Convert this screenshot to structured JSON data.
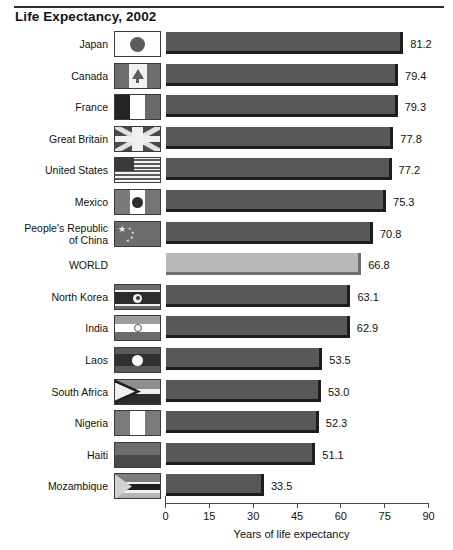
{
  "chart_data": {
    "type": "bar",
    "orientation": "horizontal",
    "title": "Life Expectancy, 2002",
    "xlabel": "Years of life expectancy",
    "ylabel": "",
    "xlim": [
      0,
      90
    ],
    "xticks": [
      0,
      15,
      30,
      45,
      60,
      75,
      90
    ],
    "grid": false,
    "legend": null,
    "categories": [
      "Japan",
      "Canada",
      "France",
      "Great Britain",
      "United States",
      "Mexico",
      "People's Republic\nof China",
      "WORLD",
      "North Korea",
      "India",
      "Laos",
      "South Africa",
      "Nigeria",
      "Haiti",
      "Mozambique"
    ],
    "values": [
      81.2,
      79.4,
      79.3,
      77.8,
      77.2,
      75.3,
      70.8,
      66.8,
      63.1,
      62.9,
      53.5,
      53.0,
      52.3,
      51.1,
      33.5
    ],
    "value_labels": [
      "81.2",
      "79.4",
      "79.3",
      "77.8",
      "77.2",
      "75.3",
      "70.8",
      "66.8",
      "63.1",
      "62.9",
      "53.5",
      "53.0",
      "52.3",
      "51.1",
      "33.5"
    ],
    "highlight_index": 7,
    "colors": {
      "bar": "#585858",
      "bar_highlight": "#b9b9b9",
      "bar_edge": "#1d1d1d",
      "axis": "#4a4a4a",
      "text": "#111111",
      "background": "#ffffff"
    },
    "flags": [
      "japan",
      "canada",
      "france",
      "great-britain",
      "united-states",
      "mexico",
      "china",
      null,
      "north-korea",
      "india",
      "laos",
      "south-africa",
      "nigeria",
      "haiti",
      "mozambique"
    ]
  }
}
